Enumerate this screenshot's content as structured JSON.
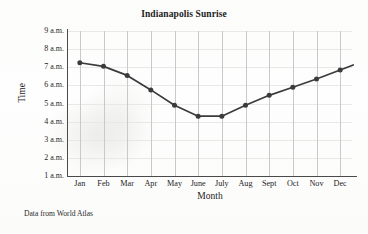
{
  "figure": {
    "title": "Indianapolis Sunrise",
    "source_note": "Data from World Atlas"
  },
  "chart_data": {
    "type": "line",
    "title": "Indianapolis Sunrise",
    "xlabel": "Month",
    "ylabel": "Time",
    "categories": [
      "Jan",
      "Feb",
      "Mar",
      "Apr",
      "May",
      "June",
      "July",
      "Aug",
      "Sept",
      "Oct",
      "Nov",
      "Dec"
    ],
    "values": [
      7.25,
      7.05,
      6.55,
      5.75,
      4.9,
      4.3,
      4.3,
      4.9,
      5.45,
      5.9,
      6.35,
      6.85
    ],
    "value_unit": "hour of day (a.m.)",
    "ylim": [
      1,
      9
    ],
    "ytick_values": [
      9,
      8,
      7,
      6,
      5,
      4,
      3,
      2,
      1
    ],
    "ytick_labels": [
      "9 a.m.",
      "8 a.m.",
      "7 a.m.",
      "6 a.m.",
      "5 a.m.",
      "4 a.m.",
      "3 a.m.",
      "2 a.m.",
      "1 a.m."
    ],
    "grid": "vertical gridlines at each month",
    "legend": "none",
    "line_color": "#3b3b3b",
    "marker_color": "#3b3b3b",
    "marker_shape": "circle",
    "line_extends_past_last_marker": true
  },
  "colors": {
    "background": "#fdfdfd",
    "axis": "#4a4a4a",
    "gridline": "#c9c9c9",
    "series": "#3b3b3b",
    "text": "#1d1d1d"
  }
}
